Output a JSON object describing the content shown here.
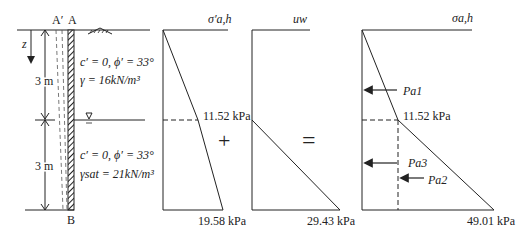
{
  "wall": {
    "top_label_left": "A′",
    "top_label_right": "A",
    "bottom_label": "B",
    "depth_axis": "z",
    "layer1_thickness": "3 m",
    "layer2_thickness": "3 m",
    "layer1_props_line1": "c′ = 0, ϕ′ = 33°",
    "layer1_props_line2": "γ = 16kN/m³",
    "layer2_props_line1": "c′ = 0, ϕ′ = 33°",
    "layer2_props_line2": "γsat = 21kN/m³"
  },
  "diagrams": {
    "effective": {
      "title": "σ′a,h",
      "mid_value": "11.52 kPa",
      "bottom_value": "19.58 kPa"
    },
    "plus_sign": "+",
    "pore": {
      "title": "uw",
      "bottom_value": "29.43 kPa"
    },
    "equals_sign": "=",
    "total": {
      "title": "σa,h",
      "mid_value": "11.52 kPa",
      "bottom_value": "49.01 kPa",
      "forces": [
        "Pa1",
        "Pa3",
        "Pa2"
      ]
    }
  },
  "colors": {
    "line": "#222222",
    "background": "#ffffff"
  }
}
